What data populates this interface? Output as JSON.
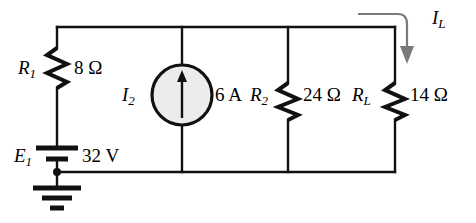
{
  "figure": {
    "kind": "electrical-circuit-schematic",
    "background_color": "#ffffff",
    "line_color": "#000000",
    "annotation_color": "#7a7a7a",
    "source_fill_color": "#ececec"
  },
  "components": {
    "r1": {
      "name": "R",
      "subscript": "1",
      "value": "8 Ω",
      "type": "resistor"
    },
    "e1": {
      "name": "E",
      "subscript": "1",
      "value": "32 V",
      "type": "voltage-source-battery"
    },
    "i2": {
      "name": "I",
      "subscript": "2",
      "value": "6 A",
      "type": "current-source"
    },
    "r2": {
      "name": "R",
      "subscript": "2",
      "value": "24 Ω",
      "type": "resistor"
    },
    "rl": {
      "name": "R",
      "subscript": "L",
      "value": "14 Ω",
      "type": "resistor"
    },
    "ground": {
      "type": "earth-ground",
      "label": ""
    }
  },
  "annotations": {
    "load_current": {
      "name": "I",
      "subscript": "L",
      "direction": "downward-into-RL-branch"
    }
  }
}
